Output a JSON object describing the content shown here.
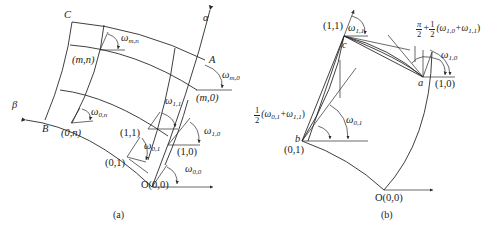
{
  "figure": {
    "panel_a": {
      "caption": "(a)",
      "corner_labels": {
        "C": "C",
        "A": "A",
        "B": "B",
        "O": "O(0,0)"
      },
      "axes": {
        "alpha": "α",
        "beta": "β"
      },
      "node_labels": {
        "mn": "(m,n)",
        "m0": "(m,0)",
        "0n": "(0,n)",
        "11": "(1,1)",
        "10": "(1,0)",
        "01": "(0,1)"
      },
      "angle_labels": {
        "w_mn": {
          "base": "ω",
          "sub": "m,n"
        },
        "w_m0": {
          "base": "ω",
          "sub": "m,0"
        },
        "w_0n": {
          "base": "ω",
          "sub": "0,n"
        },
        "w_11": {
          "base": "ω",
          "sub": "1,1"
        },
        "w_10": {
          "base": "ω",
          "sub": "1,0"
        },
        "w_01": {
          "base": "ω",
          "sub": "0,1"
        },
        "w_00": {
          "base": "ω",
          "sub": "0,0"
        }
      }
    },
    "panel_b": {
      "caption": "(b)",
      "point_labels": {
        "a": "a",
        "b": "b",
        "c": "c"
      },
      "node_labels": {
        "11": "(1,1)",
        "10": "(1,0)",
        "01": "(0,1)",
        "O": "O(0,0)"
      },
      "angle_labels": {
        "w_11": {
          "base": "ω",
          "sub": "1,1"
        },
        "w_10": {
          "base": "ω",
          "sub": "1,0"
        },
        "w_01": {
          "base": "ω",
          "sub": "0,1"
        }
      },
      "formula_a": {
        "frac1_num": "π",
        "frac1_den": "2",
        "plus": "+",
        "frac2_num": "1",
        "frac2_den": "2",
        "expr": "(ω",
        "sub1": "1,0",
        "mid": "+ω",
        "sub2": "1,1",
        "close": ")"
      },
      "formula_b": {
        "frac_num": "1",
        "frac_den": "2",
        "expr": "(ω",
        "sub1": "0,1",
        "mid": "+ω",
        "sub2": "1,1",
        "close": ")"
      }
    }
  }
}
